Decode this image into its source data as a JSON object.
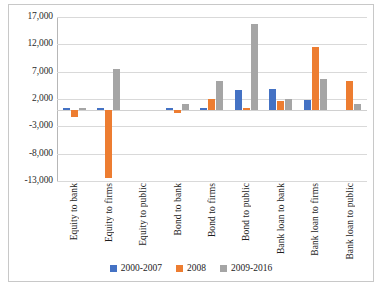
{
  "chart_data": {
    "type": "bar",
    "title": "",
    "subtitle": "",
    "xlabel": "",
    "ylabel": "",
    "grid": true,
    "legend_position": "bottom",
    "categories": [
      "Equity to bank",
      "Equity to firms",
      "Equity to public",
      "Bond to bank",
      "Bond to firms",
      "Bond to public",
      "Bank loan to bank",
      "Bank loan to firms",
      "Bank loan to public"
    ],
    "ylim": [
      -13000,
      17000
    ],
    "yticks": [
      17000,
      12000,
      7000,
      2000,
      -3000,
      -8000,
      -13000
    ],
    "ytick_labels": [
      "17,000",
      "12,000",
      "7,000",
      "2,000",
      "-3,000",
      "-8,000",
      "-13,000"
    ],
    "series": [
      {
        "name": "2000-2007",
        "color": "#4472C4",
        "values": [
          400,
          400,
          0,
          400,
          400,
          3600,
          3900,
          1800,
          0
        ]
      },
      {
        "name": "2008",
        "color": "#ED7D31",
        "values": [
          -1200,
          -12500,
          0,
          -500,
          2000,
          400,
          1700,
          11500,
          5300
        ]
      },
      {
        "name": "2009-2016",
        "color": "#A5A5A5",
        "values": [
          400,
          7400,
          0,
          1100,
          5300,
          15800,
          2000,
          5700,
          1000
        ]
      }
    ]
  },
  "legend": {
    "items": [
      {
        "label": "2000-2007",
        "color": "#4472C4"
      },
      {
        "label": "2008",
        "color": "#ED7D31"
      },
      {
        "label": "2009-2016",
        "color": "#A5A5A5"
      }
    ]
  }
}
